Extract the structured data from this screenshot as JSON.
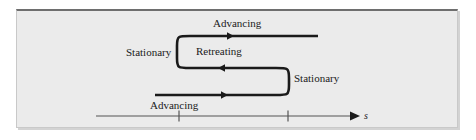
{
  "figure": {
    "title_alt": "Rotor blade advancing and retreating velocity diagram",
    "background_color": "#ebebeb",
    "page_color": "#ffffff",
    "line_color": "#1a1a1a",
    "axis_color": "#555555",
    "border_top_color": "#6e6e6e"
  },
  "labels": {
    "advancing_top": "Advancing",
    "retreating": "Retreating",
    "stationary_left": "Stationary",
    "stationary_right": "Stationary",
    "advancing_bottom": "Advancing",
    "axis": "s"
  },
  "axis": {
    "tick_count": 2,
    "ticks": [
      "",
      ""
    ],
    "arrow": "right-arrowhead"
  }
}
